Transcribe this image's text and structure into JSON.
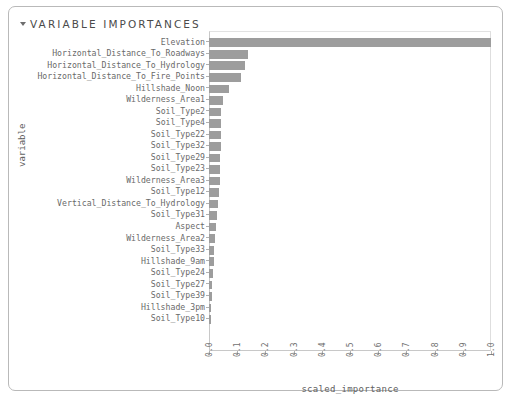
{
  "panel": {
    "title": "VARIABLE IMPORTANCES",
    "disclosure_icon": "triangle-down-icon",
    "border_color": "#b9b9b9"
  },
  "chart_data": {
    "type": "bar",
    "orientation": "horizontal",
    "title": "VARIABLE IMPORTANCES",
    "xlabel": "scaled_importance",
    "ylabel": "variable",
    "xlim": [
      0.0,
      1.0
    ],
    "grid": false,
    "legend": null,
    "bar_color": "#9d9d9d",
    "xticks": [
      "0.0",
      "0.1",
      "0.2",
      "0.3",
      "0.4",
      "0.5",
      "0.6",
      "0.7",
      "0.8",
      "0.9",
      "1.0"
    ],
    "categories": [
      "Elevation",
      "Horizontal_Distance_To_Roadways",
      "Horizontal_Distance_To_Hydrology",
      "Horizontal_Distance_To_Fire_Points",
      "Hillshade_Noon",
      "Wilderness_Area1",
      "Soil_Type2",
      "Soil_Type4",
      "Soil_Type22",
      "Soil_Type32",
      "Soil_Type29",
      "Soil_Type23",
      "Wilderness_Area3",
      "Soil_Type12",
      "Vertical_Distance_To_Hydrology",
      "Soil_Type31",
      "Aspect",
      "Wilderness_Area2",
      "Soil_Type33",
      "Hillshade_9am",
      "Soil_Type24",
      "Soil_Type27",
      "Soil_Type39",
      "Hillshade_3pm",
      "Soil_Type10"
    ],
    "values": [
      1.0,
      0.14,
      0.127,
      0.115,
      0.07,
      0.05,
      0.044,
      0.043,
      0.042,
      0.041,
      0.04,
      0.039,
      0.038,
      0.036,
      0.033,
      0.028,
      0.024,
      0.021,
      0.019,
      0.016,
      0.014,
      0.012,
      0.01,
      0.008,
      0.005
    ]
  }
}
